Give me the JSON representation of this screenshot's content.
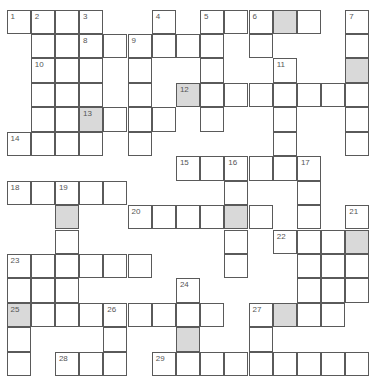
{
  "puzzle": {
    "rows": 15,
    "cols": 15,
    "cell_px": 24.2,
    "shaded_color": "#d9d9d9",
    "line_color": "#5a5a5a",
    "cells": [
      [
        0,
        0,
        "1",
        0
      ],
      [
        0,
        1,
        "2",
        0
      ],
      [
        0,
        2,
        "",
        0
      ],
      [
        0,
        3,
        "3",
        0
      ],
      [
        0,
        6,
        "4",
        0
      ],
      [
        0,
        8,
        "5",
        0
      ],
      [
        0,
        9,
        "",
        0
      ],
      [
        0,
        10,
        "6",
        0
      ],
      [
        0,
        11,
        "",
        1
      ],
      [
        0,
        12,
        "",
        0
      ],
      [
        0,
        14,
        "7",
        0
      ],
      [
        1,
        1,
        "",
        0
      ],
      [
        1,
        2,
        "",
        0
      ],
      [
        1,
        3,
        "8",
        0
      ],
      [
        1,
        4,
        "",
        0
      ],
      [
        1,
        5,
        "9",
        0
      ],
      [
        1,
        6,
        "",
        0
      ],
      [
        1,
        7,
        "",
        0
      ],
      [
        1,
        8,
        "",
        0
      ],
      [
        1,
        10,
        "",
        0
      ],
      [
        1,
        14,
        "",
        0
      ],
      [
        2,
        1,
        "10",
        0
      ],
      [
        2,
        2,
        "",
        0
      ],
      [
        2,
        3,
        "",
        0
      ],
      [
        2,
        5,
        "",
        0
      ],
      [
        2,
        8,
        "",
        0
      ],
      [
        2,
        11,
        "11",
        0
      ],
      [
        2,
        14,
        "",
        1
      ],
      [
        3,
        1,
        "",
        0
      ],
      [
        3,
        2,
        "",
        0
      ],
      [
        3,
        3,
        "",
        0
      ],
      [
        3,
        5,
        "",
        0
      ],
      [
        3,
        7,
        "12",
        1
      ],
      [
        3,
        8,
        "",
        0
      ],
      [
        3,
        9,
        "",
        0
      ],
      [
        3,
        10,
        "",
        0
      ],
      [
        3,
        11,
        "",
        0
      ],
      [
        3,
        12,
        "",
        0
      ],
      [
        3,
        13,
        "",
        0
      ],
      [
        3,
        14,
        "",
        0
      ],
      [
        4,
        1,
        "",
        0
      ],
      [
        4,
        2,
        "",
        0
      ],
      [
        4,
        3,
        "13",
        1
      ],
      [
        4,
        4,
        "",
        0
      ],
      [
        4,
        5,
        "",
        0
      ],
      [
        4,
        6,
        "",
        0
      ],
      [
        4,
        8,
        "",
        0
      ],
      [
        4,
        11,
        "",
        0
      ],
      [
        4,
        14,
        "",
        0
      ],
      [
        5,
        0,
        "14",
        0
      ],
      [
        5,
        1,
        "",
        0
      ],
      [
        5,
        2,
        "",
        0
      ],
      [
        5,
        3,
        "",
        0
      ],
      [
        5,
        5,
        "",
        0
      ],
      [
        5,
        11,
        "",
        0
      ],
      [
        5,
        14,
        "",
        0
      ],
      [
        6,
        7,
        "15",
        0
      ],
      [
        6,
        8,
        "",
        0
      ],
      [
        6,
        9,
        "16",
        0
      ],
      [
        6,
        10,
        "",
        0
      ],
      [
        6,
        11,
        "",
        0
      ],
      [
        6,
        12,
        "17",
        0
      ],
      [
        7,
        0,
        "18",
        0
      ],
      [
        7,
        1,
        "",
        0
      ],
      [
        7,
        2,
        "19",
        0
      ],
      [
        7,
        3,
        "",
        0
      ],
      [
        7,
        4,
        "",
        0
      ],
      [
        7,
        9,
        "",
        0
      ],
      [
        7,
        12,
        "",
        0
      ],
      [
        8,
        2,
        "",
        1
      ],
      [
        8,
        5,
        "20",
        0
      ],
      [
        8,
        6,
        "",
        0
      ],
      [
        8,
        7,
        "",
        0
      ],
      [
        8,
        8,
        "",
        0
      ],
      [
        8,
        9,
        "",
        1
      ],
      [
        8,
        10,
        "",
        0
      ],
      [
        8,
        12,
        "",
        0
      ],
      [
        8,
        14,
        "21",
        0
      ],
      [
        9,
        2,
        "",
        0
      ],
      [
        9,
        9,
        "",
        0
      ],
      [
        9,
        11,
        "22",
        0
      ],
      [
        9,
        12,
        "",
        0
      ],
      [
        9,
        13,
        "",
        0
      ],
      [
        9,
        14,
        "",
        1
      ],
      [
        10,
        0,
        "23",
        0
      ],
      [
        10,
        1,
        "",
        0
      ],
      [
        10,
        2,
        "",
        0
      ],
      [
        10,
        3,
        "",
        0
      ],
      [
        10,
        4,
        "",
        0
      ],
      [
        10,
        5,
        "",
        0
      ],
      [
        10,
        9,
        "",
        0
      ],
      [
        10,
        12,
        "",
        0
      ],
      [
        10,
        13,
        "",
        0
      ],
      [
        10,
        14,
        "",
        0
      ],
      [
        11,
        0,
        "",
        0
      ],
      [
        11,
        1,
        "",
        0
      ],
      [
        11,
        2,
        "",
        0
      ],
      [
        11,
        7,
        "24",
        0
      ],
      [
        11,
        12,
        "",
        0
      ],
      [
        11,
        13,
        "",
        0
      ],
      [
        11,
        14,
        "",
        0
      ],
      [
        12,
        0,
        "25",
        1
      ],
      [
        12,
        1,
        "",
        0
      ],
      [
        12,
        2,
        "",
        0
      ],
      [
        12,
        3,
        "",
        0
      ],
      [
        12,
        4,
        "26",
        0
      ],
      [
        12,
        5,
        "",
        0
      ],
      [
        12,
        6,
        "",
        0
      ],
      [
        12,
        7,
        "",
        0
      ],
      [
        12,
        8,
        "",
        0
      ],
      [
        12,
        10,
        "27",
        0
      ],
      [
        12,
        11,
        "",
        1
      ],
      [
        12,
        12,
        "",
        0
      ],
      [
        12,
        13,
        "",
        0
      ],
      [
        13,
        0,
        "",
        0
      ],
      [
        13,
        4,
        "",
        0
      ],
      [
        13,
        7,
        "",
        1
      ],
      [
        13,
        10,
        "",
        0
      ],
      [
        14,
        0,
        "",
        0
      ],
      [
        14,
        2,
        "28",
        0
      ],
      [
        14,
        3,
        "",
        0
      ],
      [
        14,
        4,
        "",
        0
      ],
      [
        14,
        6,
        "29",
        0
      ],
      [
        14,
        7,
        "",
        0
      ],
      [
        14,
        8,
        "",
        0
      ],
      [
        14,
        9,
        "",
        0
      ],
      [
        14,
        10,
        "",
        0
      ],
      [
        14,
        11,
        "",
        0
      ],
      [
        14,
        12,
        "",
        0
      ],
      [
        14,
        13,
        "",
        0
      ],
      [
        14,
        14,
        "",
        0
      ]
    ]
  }
}
